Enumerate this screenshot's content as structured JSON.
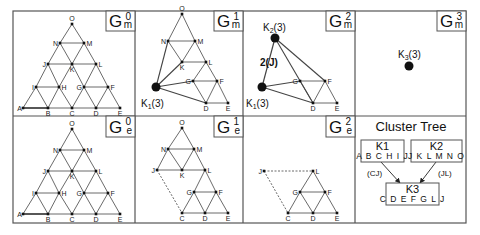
{
  "colors": {
    "line": "#444444",
    "border": "#555555",
    "node": "#111111",
    "bg": "#ffffff"
  },
  "frame": {
    "x": 13,
    "y": 11,
    "w": 453,
    "h": 212,
    "cols": [
      135,
      243,
      355
    ],
    "row": 116
  },
  "panels": [
    {
      "id": "Gm0",
      "label": "G",
      "sup": "0",
      "sub": "m",
      "box": [
        106,
        11,
        29,
        20
      ],
      "nodes": {
        "O": [
          72,
          24
        ],
        "N": [
          60,
          43
        ],
        "M": [
          84,
          43
        ],
        "J": [
          48,
          64
        ],
        "K": [
          72,
          64
        ],
        "L": [
          96,
          64
        ],
        "I": [
          36,
          87
        ],
        "H": [
          59,
          87
        ],
        "G": [
          84,
          87
        ],
        "F": [
          108,
          87
        ],
        "A": [
          23,
          108
        ],
        "B": [
          48,
          108
        ],
        "C": [
          72,
          108
        ],
        "D": [
          96,
          108
        ],
        "E": [
          120,
          108
        ]
      },
      "edges": [
        [
          "O",
          "N"
        ],
        [
          "O",
          "M"
        ],
        [
          "N",
          "M"
        ],
        [
          "N",
          "J"
        ],
        [
          "N",
          "K"
        ],
        [
          "M",
          "K"
        ],
        [
          "M",
          "L"
        ],
        [
          "J",
          "K"
        ],
        [
          "K",
          "L"
        ],
        [
          "J",
          "I"
        ],
        [
          "J",
          "H"
        ],
        [
          "K",
          "H"
        ],
        [
          "K",
          "G"
        ],
        [
          "L",
          "G"
        ],
        [
          "L",
          "F"
        ],
        [
          "I",
          "H"
        ],
        [
          "G",
          "F"
        ],
        [
          "I",
          "A"
        ],
        [
          "I",
          "B"
        ],
        [
          "H",
          "B"
        ],
        [
          "H",
          "C"
        ],
        [
          "G",
          "C"
        ],
        [
          "G",
          "D"
        ],
        [
          "F",
          "D"
        ],
        [
          "F",
          "E"
        ],
        [
          "A",
          "B"
        ],
        [
          "B",
          "C"
        ],
        [
          "C",
          "D"
        ],
        [
          "D",
          "E"
        ]
      ],
      "thick": [
        [
          "A",
          "B"
        ]
      ],
      "dashed": [],
      "clusters": []
    },
    {
      "id": "Gm1",
      "label": "G",
      "sup": "1",
      "sub": "m",
      "box": [
        214,
        11,
        29,
        20
      ],
      "nodes": {
        "O": [
          182,
          14
        ],
        "N": [
          168,
          41
        ],
        "M": [
          195,
          41
        ],
        "K": [
          182,
          62
        ],
        "L": [
          206,
          62
        ],
        "G": [
          193,
          81
        ],
        "F": [
          217,
          81
        ],
        "D": [
          206,
          103
        ],
        "E": [
          228,
          103
        ]
      },
      "edges": [
        [
          "O",
          "N"
        ],
        [
          "O",
          "M"
        ],
        [
          "N",
          "M"
        ],
        [
          "N",
          "K"
        ],
        [
          "M",
          "K"
        ],
        [
          "M",
          "L"
        ],
        [
          "K",
          "L"
        ],
        [
          "L",
          "G"
        ],
        [
          "L",
          "F"
        ],
        [
          "G",
          "F"
        ],
        [
          "G",
          "D"
        ],
        [
          "F",
          "D"
        ],
        [
          "F",
          "E"
        ],
        [
          "D",
          "E"
        ]
      ],
      "thick": [],
      "dashed": [],
      "clusters": [
        {
          "name": "K1",
          "label": "K",
          "sub": "1",
          "weight": "(3)",
          "pos": [
            156,
            87
          ],
          "label_pos": [
            141,
            107
          ],
          "links": [
            "N",
            "K",
            "G",
            "D"
          ]
        }
      ]
    },
    {
      "id": "Gm2",
      "label": "G",
      "sup": "2",
      "sub": "m",
      "box": [
        326,
        11,
        29,
        20
      ],
      "nodes": {
        "G": [
          300,
          81
        ],
        "F": [
          325,
          81
        ],
        "D": [
          313,
          103
        ],
        "E": [
          337,
          103
        ]
      },
      "edges": [
        [
          "G",
          "F"
        ],
        [
          "G",
          "D"
        ],
        [
          "F",
          "D"
        ],
        [
          "F",
          "E"
        ],
        [
          "D",
          "E"
        ]
      ],
      "thick": [],
      "dashed": [],
      "clusters": [
        {
          "name": "K2",
          "label": "K",
          "sub": "2",
          "weight": "(3)",
          "pos": [
            275,
            38
          ],
          "label_pos": [
            263,
            31
          ],
          "links": [
            "D",
            "F"
          ]
        },
        {
          "name": "K1",
          "label": "K",
          "sub": "1",
          "weight": "(3)",
          "pos": [
            262,
            87
          ],
          "label_pos": [
            246,
            107
          ],
          "links": [
            "G",
            "D"
          ]
        }
      ],
      "cluster_edge": {
        "from": "K2",
        "to": "K1",
        "label": "2(J)",
        "label_pos": [
          260,
          66
        ]
      }
    },
    {
      "id": "Gm3",
      "label": "G",
      "sup": "3",
      "sub": "m",
      "box": [
        437,
        11,
        29,
        20
      ],
      "nodes": {},
      "edges": [],
      "thick": [],
      "dashed": [],
      "clusters": [
        {
          "name": "K3",
          "label": "K",
          "sub": "3",
          "weight": "(3)",
          "pos": [
            409,
            66
          ],
          "label_pos": [
            398,
            58
          ],
          "links": []
        }
      ]
    },
    {
      "id": "Ge0",
      "label": "G",
      "sup": "0",
      "sub": "e",
      "box": [
        106,
        116,
        29,
        21
      ],
      "nodes": {
        "O": [
          72,
          129
        ],
        "N": [
          60,
          150
        ],
        "M": [
          84,
          150
        ],
        "J": [
          48,
          171
        ],
        "K": [
          72,
          171
        ],
        "L": [
          96,
          171
        ],
        "I": [
          36,
          193
        ],
        "H": [
          59,
          193
        ],
        "G": [
          84,
          193
        ],
        "F": [
          108,
          193
        ],
        "A": [
          23,
          214
        ],
        "B": [
          48,
          214
        ],
        "C": [
          72,
          214
        ],
        "D": [
          96,
          214
        ],
        "E": [
          120,
          214
        ]
      },
      "edges": [
        [
          "O",
          "N"
        ],
        [
          "O",
          "M"
        ],
        [
          "N",
          "M"
        ],
        [
          "N",
          "J"
        ],
        [
          "N",
          "K"
        ],
        [
          "M",
          "K"
        ],
        [
          "M",
          "L"
        ],
        [
          "J",
          "K"
        ],
        [
          "K",
          "L"
        ],
        [
          "J",
          "I"
        ],
        [
          "J",
          "H"
        ],
        [
          "K",
          "H"
        ],
        [
          "K",
          "G"
        ],
        [
          "L",
          "G"
        ],
        [
          "L",
          "F"
        ],
        [
          "I",
          "H"
        ],
        [
          "G",
          "F"
        ],
        [
          "I",
          "A"
        ],
        [
          "I",
          "B"
        ],
        [
          "H",
          "B"
        ],
        [
          "H",
          "C"
        ],
        [
          "G",
          "C"
        ],
        [
          "G",
          "D"
        ],
        [
          "F",
          "D"
        ],
        [
          "F",
          "E"
        ],
        [
          "A",
          "B"
        ],
        [
          "B",
          "C"
        ],
        [
          "C",
          "D"
        ],
        [
          "D",
          "E"
        ]
      ],
      "thick": [
        [
          "A",
          "B"
        ]
      ],
      "dashed": [],
      "clusters": []
    },
    {
      "id": "Ge1",
      "label": "G",
      "sup": "1",
      "sub": "e",
      "box": [
        214,
        116,
        29,
        21
      ],
      "nodes": {
        "O": [
          182,
          128
        ],
        "N": [
          168,
          149
        ],
        "M": [
          194,
          149
        ],
        "J": [
          157,
          170
        ],
        "K": [
          182,
          170
        ],
        "L": [
          205,
          170
        ],
        "G": [
          194,
          192
        ],
        "F": [
          216,
          192
        ],
        "C": [
          182,
          213
        ],
        "D": [
          205,
          213
        ],
        "E": [
          228,
          213
        ]
      },
      "edges": [
        [
          "O",
          "N"
        ],
        [
          "O",
          "M"
        ],
        [
          "N",
          "M"
        ],
        [
          "N",
          "J"
        ],
        [
          "N",
          "K"
        ],
        [
          "M",
          "K"
        ],
        [
          "M",
          "L"
        ],
        [
          "J",
          "K"
        ],
        [
          "K",
          "L"
        ],
        [
          "L",
          "G"
        ],
        [
          "L",
          "F"
        ],
        [
          "G",
          "F"
        ],
        [
          "G",
          "C"
        ],
        [
          "G",
          "D"
        ],
        [
          "F",
          "D"
        ],
        [
          "F",
          "E"
        ],
        [
          "C",
          "D"
        ],
        [
          "D",
          "E"
        ]
      ],
      "thick": [],
      "dashed": [
        [
          "J",
          "C"
        ]
      ],
      "clusters": []
    },
    {
      "id": "Ge2",
      "label": "G",
      "sup": "2",
      "sub": "e",
      "box": [
        326,
        116,
        29,
        21
      ],
      "nodes": {
        "J": [
          264,
          171
        ],
        "L": [
          313,
          171
        ],
        "G": [
          300,
          192
        ],
        "F": [
          325,
          192
        ],
        "C": [
          288,
          213
        ],
        "D": [
          313,
          213
        ],
        "E": [
          337,
          213
        ]
      },
      "edges": [
        [
          "L",
          "G"
        ],
        [
          "L",
          "F"
        ],
        [
          "G",
          "F"
        ],
        [
          "G",
          "C"
        ],
        [
          "G",
          "D"
        ],
        [
          "F",
          "D"
        ],
        [
          "F",
          "E"
        ],
        [
          "C",
          "D"
        ],
        [
          "D",
          "E"
        ]
      ],
      "thick": [],
      "dashed": [
        [
          "J",
          "L"
        ],
        [
          "J",
          "C"
        ]
      ],
      "clusters": []
    }
  ],
  "cluster_tree": {
    "title": "Cluster Tree",
    "title_pos": [
      411,
      131
    ],
    "nodes": [
      {
        "name": "K1",
        "members": "A B C H I J",
        "box": [
          361,
          140,
          43,
          22
        ]
      },
      {
        "name": "K2",
        "members": "J K L M N O",
        "box": [
          411,
          140,
          51,
          22
        ]
      },
      {
        "name": "K3",
        "members": "C D E F G L J",
        "box": [
          386,
          183,
          53,
          22
        ]
      }
    ],
    "edges": [
      {
        "from": [
          381,
          162
        ],
        "to": [
          400,
          183
        ],
        "label": "(CJ)",
        "label_pos": [
          367,
          176
        ]
      },
      {
        "from": [
          436,
          162
        ],
        "to": [
          420,
          183
        ],
        "label": "(JL)",
        "label_pos": [
          438,
          176
        ]
      }
    ]
  }
}
